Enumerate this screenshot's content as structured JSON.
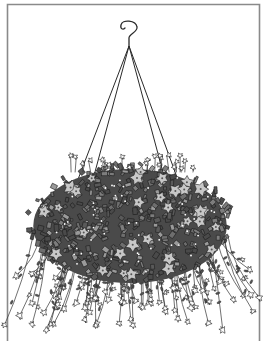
{
  "illustration": {
    "subject": "hanging flower basket",
    "style": "black and white line drawing",
    "background_color": "#ffffff",
    "frame": {
      "color": "#8a8a8a",
      "left_x": 7.5,
      "right_x": 259.5,
      "top_y": 4.5,
      "bottom_open": true
    },
    "hook": {
      "center_x": 128,
      "top_y": 20,
      "bottom_y": 46
    },
    "wires": {
      "apex": [
        129,
        46
      ],
      "anchors": [
        [
          77,
          182
        ],
        [
          92,
          183
        ],
        [
          164,
          176
        ],
        [
          178,
          180
        ]
      ]
    },
    "basket": {
      "center": [
        130,
        222
      ],
      "rx": 104,
      "ry": 62,
      "foliage_dark": "#4a4a4a",
      "foliage_mid": "#6e6e6e",
      "foliage_light": "#9a9a9a",
      "bloom_fill": "#c8c8c8",
      "bloom_count": 34,
      "leaf_count": 420
    },
    "trailing": {
      "stem_count": 70,
      "max_y": 330,
      "flower_fill": "#ffffff"
    }
  }
}
